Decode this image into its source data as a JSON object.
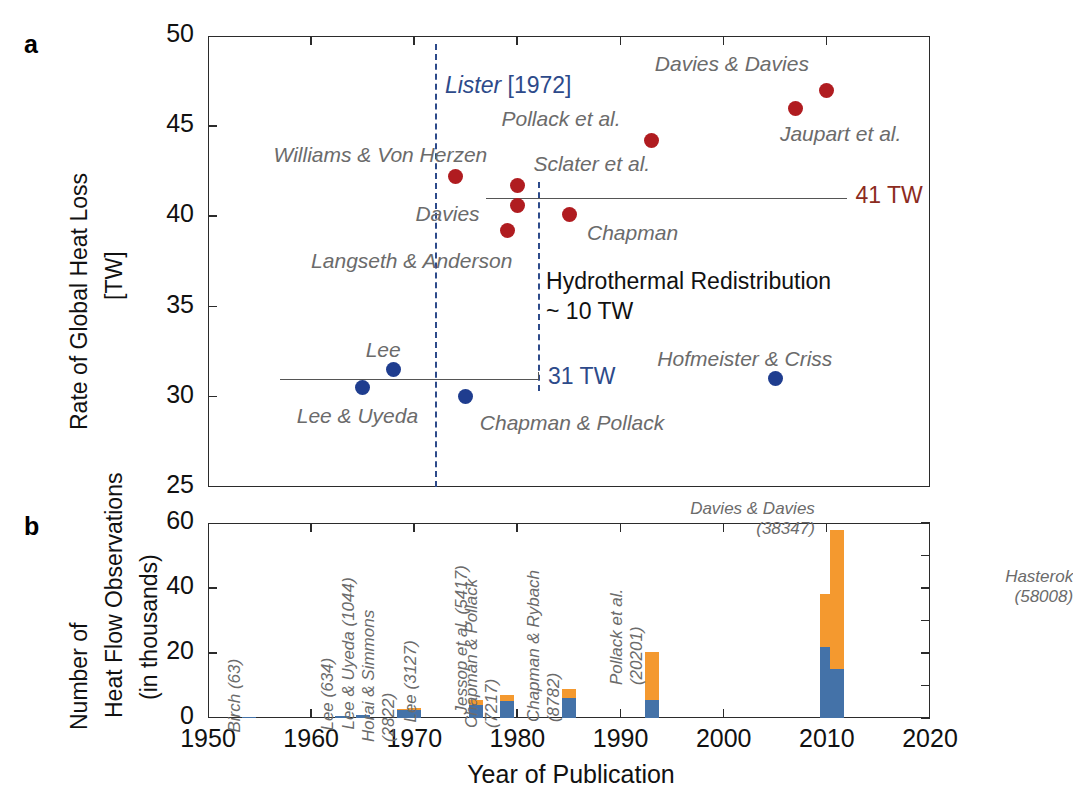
{
  "panels": {
    "a": {
      "letter": "a",
      "ylabel_line1": "Rate of Global Heat Loss",
      "ylabel_line2": "[TW]",
      "yticks": [
        25,
        30,
        35,
        40,
        45,
        50
      ],
      "ylim": [
        25,
        50
      ],
      "xlim": [
        1950,
        2020
      ]
    },
    "b": {
      "letter": "b",
      "ylabel_line1": "Number of",
      "ylabel_line2": "Heat Flow Observations",
      "ylabel_line3": "(in thousands)",
      "yticks": [
        0,
        20,
        40,
        60
      ],
      "ylim": [
        0,
        60
      ],
      "xlim": [
        1950,
        2020
      ]
    }
  },
  "xaxis": {
    "title": "Year of Publication",
    "ticks": [
      1950,
      1960,
      1970,
      1980,
      1990,
      2000,
      2010,
      2020
    ]
  },
  "annotations": {
    "lister_italic": "Lister",
    "lister_year": "[1972]",
    "tw41": "41 TW",
    "tw31": "31 TW",
    "hydrothermal_line1": "Hydrothermal Redistribution",
    "hydrothermal_line2": "~ 10 TW"
  },
  "colors": {
    "red_marker": "#b01c20",
    "blue_marker": "#1f3d8f",
    "dashed_blue": "#2d4a8a",
    "bar_blue": "#4472a8",
    "bar_orange": "#f4992f",
    "label_gray": "#6b6b6b",
    "tw41_color": "#8c2b20",
    "tw31_color": "#2d4a8a"
  },
  "chart_data": [
    {
      "type": "scatter",
      "title": "Rate of Global Heat Loss",
      "xlabel": "Year of Publication",
      "ylabel": "Rate of Global Heat Loss [TW]",
      "xlim": [
        1950,
        2020
      ],
      "ylim": [
        25,
        50
      ],
      "grid": false,
      "legend": "none",
      "series": [
        {
          "name": "High estimates (41 TW group)",
          "color": "#b01c20",
          "points": [
            {
              "label": "Williams & Von Herzen",
              "x": 1974,
              "y": 42.2
            },
            {
              "label": "Langseth & Anderson",
              "x": 1979,
              "y": 39.2
            },
            {
              "label": "Sclater et al.",
              "x": 1980,
              "y": 41.7
            },
            {
              "label": "Davies",
              "x": 1980,
              "y": 40.6
            },
            {
              "label": "Chapman",
              "x": 1985,
              "y": 40.1
            },
            {
              "label": "Pollack et al.",
              "x": 1993,
              "y": 44.2
            },
            {
              "label": "Jaupart et al.",
              "x": 2007,
              "y": 46.0
            },
            {
              "label": "Davies & Davies",
              "x": 2010,
              "y": 47.0
            }
          ]
        },
        {
          "name": "Low estimates (31 TW group)",
          "color": "#1f3d8f",
          "points": [
            {
              "label": "Lee & Uyeda",
              "x": 1965,
              "y": 30.5
            },
            {
              "label": "Lee",
              "x": 1968,
              "y": 31.5
            },
            {
              "label": "Chapman & Pollack",
              "x": 1975,
              "y": 30.0
            },
            {
              "label": "Hofmeister & Criss",
              "x": 2005,
              "y": 31.0
            }
          ]
        }
      ],
      "reference_lines": [
        {
          "label": "41 TW",
          "y": 41.0,
          "x_start": 1988,
          "x_end": 2012,
          "color": "#8c2b20"
        },
        {
          "label": "31 TW",
          "y": 31.0,
          "x_start": 1957,
          "x_end": 1982,
          "color": "#2d4a8a"
        },
        {
          "label": "Lister [1972]",
          "x": 1972,
          "type": "vertical-dashed",
          "color": "#2d4a8a"
        },
        {
          "label": "Hydrothermal step",
          "x": 1982,
          "type": "vertical-dashed",
          "color": "#2d4a8a"
        }
      ]
    },
    {
      "type": "bar",
      "title": "Number of Heat Flow Observations (in thousands)",
      "xlabel": "Year of Publication",
      "ylabel": "Number of Heat Flow Observations (in thousands)",
      "xlim": [
        1950,
        2020
      ],
      "ylim": [
        0,
        60
      ],
      "stacked": true,
      "grid": false,
      "legend": "none",
      "series_names": [
        "marine/continental (blue)",
        "additional (orange)"
      ],
      "bars": [
        {
          "label": "Birch",
          "count": "63",
          "x": 1954,
          "total": 0.063,
          "blue": 0.063,
          "orange": 0.0
        },
        {
          "label": "Lee",
          "count": "634",
          "x": 1963,
          "total": 0.634,
          "blue": 0.5,
          "orange": 0.134
        },
        {
          "label": "Lee & Uyeda",
          "count": "1044",
          "x": 1965,
          "total": 1.044,
          "blue": 0.9,
          "orange": 0.144
        },
        {
          "label": "Horai & Simmons",
          "count": "2822",
          "x": 1969,
          "total": 2.822,
          "blue": 2.4,
          "orange": 0.42
        },
        {
          "label": "Lee",
          "count": "3127",
          "x": 1970,
          "total": 3.127,
          "blue": 2.6,
          "orange": 0.53
        },
        {
          "label": "Jessop et al.",
          "count": "5417",
          "x": 1976,
          "total": 5.417,
          "blue": 4.1,
          "orange": 1.3
        },
        {
          "label": "Chapman & Pollack",
          "count": "7217",
          "x": 1979,
          "total": 7.217,
          "blue": 5.2,
          "orange": 2.0
        },
        {
          "label": "Chapman & Rybach",
          "count": "8782",
          "x": 1985,
          "total": 8.782,
          "blue": 6.2,
          "orange": 2.6
        },
        {
          "label": "Pollack et al.",
          "count": "20201",
          "x": 1993,
          "total": 20.201,
          "blue": 5.6,
          "orange": 14.6
        },
        {
          "label": "Davies & Davies",
          "count": "38347",
          "x": 2010,
          "total": 38.347,
          "blue": 21.8,
          "orange": 16.5
        },
        {
          "label": "Hasterok",
          "count": "58008",
          "x": 2011,
          "total": 58.008,
          "blue": 15.0,
          "orange": 43.0
        }
      ]
    }
  ]
}
